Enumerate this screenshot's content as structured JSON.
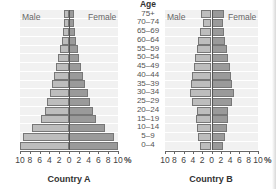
{
  "age_header": "Age",
  "age_groups": [
    "75+",
    "70–74",
    "65–69",
    "60–64",
    "55–59",
    "50–54",
    "45–49",
    "40–44",
    "35–39",
    "30–34",
    "25–29",
    "20–24",
    "15–19",
    "10–14",
    "5–9",
    "0–4"
  ],
  "labels": {
    "male": "Male",
    "female": "Female",
    "percent": "%"
  },
  "ticks": [
    "10",
    "8",
    "6",
    "4",
    "2",
    "0",
    "2",
    "4",
    "6",
    "8",
    "10"
  ],
  "chart_data": [
    {
      "type": "bar",
      "subtype": "population-pyramid",
      "title": "Country A",
      "xlabel": "%",
      "ylabel": "Age",
      "xlim": [
        -10,
        10
      ],
      "categories": [
        "75+",
        "70–74",
        "65–69",
        "60–64",
        "55–59",
        "50–54",
        "45–49",
        "40–44",
        "35–39",
        "30–34",
        "25–29",
        "20–24",
        "15–19",
        "10–14",
        "5–9",
        "0–4"
      ],
      "series": [
        {
          "name": "Male",
          "values": [
            1.0,
            1.0,
            1.2,
            1.5,
            1.8,
            2.2,
            2.6,
            3.0,
            3.5,
            3.9,
            4.4,
            5.0,
            5.7,
            7.6,
            9.4,
            10.0
          ]
        },
        {
          "name": "Female",
          "values": [
            1.0,
            1.0,
            1.2,
            1.5,
            1.8,
            2.1,
            2.5,
            2.9,
            3.3,
            3.8,
            4.3,
            4.8,
            5.5,
            7.4,
            9.1,
            9.9
          ]
        }
      ],
      "legend": [
        "Male",
        "Female"
      ],
      "grid": true
    },
    {
      "type": "bar",
      "subtype": "population-pyramid",
      "title": "Country B",
      "xlabel": "%",
      "ylabel": "Age",
      "xlim": [
        -10,
        10
      ],
      "categories": [
        "75+",
        "70–74",
        "65–69",
        "60–64",
        "55–59",
        "50–54",
        "45–49",
        "40–44",
        "35–39",
        "30–34",
        "25–29",
        "20–24",
        "15–19",
        "10–14",
        "5–9",
        "0–4"
      ],
      "series": [
        {
          "name": "Male",
          "values": [
            2.2,
            1.8,
            2.4,
            2.8,
            3.2,
            3.5,
            3.8,
            4.1,
            4.4,
            4.6,
            4.3,
            3.2,
            3.4,
            3.2,
            2.8,
            2.4
          ]
        },
        {
          "name": "Female",
          "values": [
            2.6,
            2.4,
            2.7,
            3.0,
            3.3,
            3.6,
            3.9,
            4.2,
            4.5,
            4.8,
            4.5,
            3.6,
            3.6,
            3.3,
            2.8,
            2.5
          ]
        }
      ],
      "legend": [
        "Male",
        "Female"
      ],
      "grid": true
    }
  ]
}
